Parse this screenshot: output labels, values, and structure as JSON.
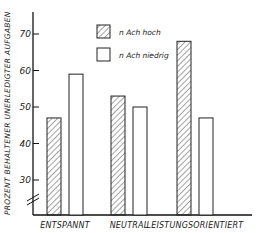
{
  "chart_data": {
    "type": "bar",
    "title": "",
    "xlabel": "",
    "ylabel": "PROZENT BEHALTENER UNERLEDIGTER AUFGABEN",
    "categories": [
      "ENTSPANNT",
      "NEUTRAL",
      "LEISTUNGSORIENTIERT"
    ],
    "series": [
      {
        "name": "n Ach hoch",
        "pattern": "hatched",
        "values": [
          47,
          53,
          68
        ]
      },
      {
        "name": "n Ach niedrig",
        "pattern": "open",
        "values": [
          59,
          50,
          47
        ]
      }
    ],
    "yticks": [
      30,
      40,
      50,
      60,
      70
    ],
    "ylim": [
      20,
      77
    ],
    "axis_break": true,
    "grid": false,
    "legend_position": "top-center"
  }
}
